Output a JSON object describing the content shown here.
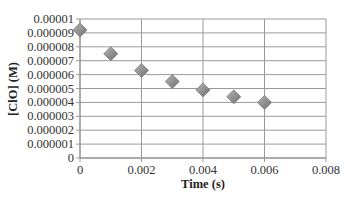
{
  "chart_data": {
    "type": "scatter",
    "title": "",
    "xlabel": "Time (s)",
    "ylabel": "[ClO] (M)",
    "xlim": [
      0,
      0.008
    ],
    "ylim": [
      0,
      1e-05
    ],
    "x_ticks": [
      "0",
      "0.002",
      "0.004",
      "0.006",
      "0.008"
    ],
    "y_ticks": [
      "0",
      "0.000001",
      "0.000002",
      "0.000003",
      "0.000004",
      "0.000005",
      "0.000006",
      "0.000007",
      "0.000008",
      "0.000009",
      "0.00001"
    ],
    "grid": true,
    "legend": null,
    "marker": "diamond",
    "marker_color": "#8a8a8a",
    "series": [
      {
        "name": "[ClO]",
        "x": [
          0,
          0.001,
          0.002,
          0.003,
          0.004,
          0.005,
          0.006
        ],
        "y": [
          9.2e-06,
          7.5e-06,
          6.3e-06,
          5.5e-06,
          4.9e-06,
          4.4e-06,
          4e-06
        ]
      }
    ]
  }
}
